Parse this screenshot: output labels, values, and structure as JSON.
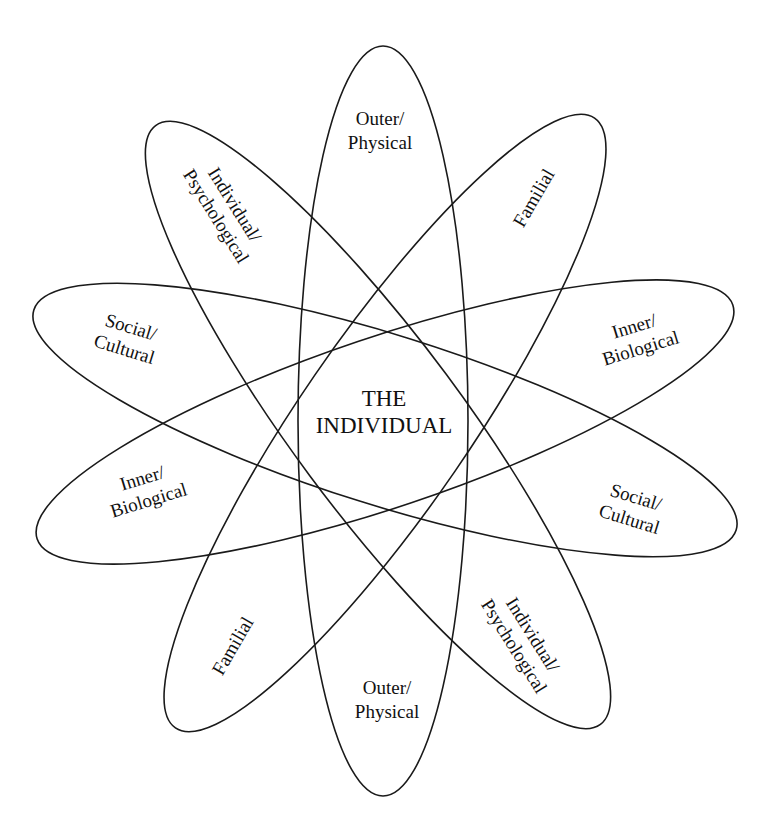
{
  "diagram": {
    "center_label": {
      "line1": "THE",
      "line2": "INDIVIDUAL"
    },
    "colors": {
      "stroke": "#1a1a1a",
      "text": "#111111",
      "background": "#ffffff"
    },
    "dimensions": [
      {
        "id": "outer-physical",
        "line1": "Outer/",
        "line2": "Physical"
      },
      {
        "id": "individual-psychological",
        "line1": "Individual/",
        "line2": "Psychological"
      },
      {
        "id": "familial",
        "line1": "Familial",
        "line2": ""
      },
      {
        "id": "social-cultural",
        "line1": "Social/",
        "line2": "Cultural"
      },
      {
        "id": "inner-biological",
        "line1": "Inner/",
        "line2": "Biological"
      }
    ]
  }
}
